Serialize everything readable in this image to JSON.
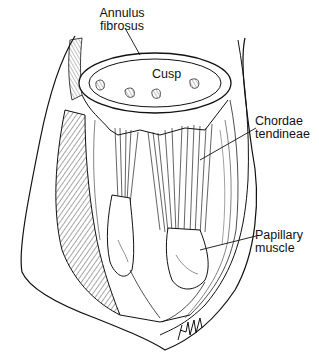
{
  "figure": {
    "style": "black-and-white line illustration",
    "ink_color": "#111111",
    "background_color": "#ffffff",
    "labels": {
      "annulus": {
        "line1": "Annulus",
        "line2": "fibrosus"
      },
      "cusp": {
        "line1": "Cusp"
      },
      "chordae": {
        "line1": "Chordae",
        "line2": "tendineae"
      },
      "papillary": {
        "line1": "Papillary",
        "line2": "muscle"
      }
    },
    "signature_icon": "artist-signature"
  }
}
